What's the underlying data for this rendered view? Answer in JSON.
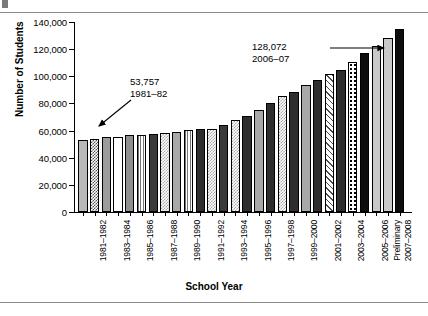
{
  "chart_data": {
    "type": "bar",
    "title": "",
    "xlabel": "School Year",
    "ylabel": "Number of Students",
    "ylim": [
      0,
      140000
    ],
    "ytick_labels": [
      "0",
      "20,000",
      "40,000",
      "60,000",
      "80,000",
      "100,000",
      "120,000",
      "140,000"
    ],
    "ytick_values": [
      0,
      20000,
      40000,
      60000,
      80000,
      100000,
      120000,
      140000
    ],
    "grid": false,
    "legend": "none",
    "categories": [
      "1980-1981",
      "1981-1982",
      "1982-1983",
      "1983-1984",
      "1984-1985",
      "1985-1986",
      "1986-1987",
      "1987-1988",
      "1988-1989",
      "1989-1990",
      "1990-1991",
      "1991-1992",
      "1992-1993",
      "1993-1994",
      "1994-1995",
      "1995-1996",
      "1996-1997",
      "1997-1998",
      "1998-1999",
      "1999-2000",
      "2000-2001",
      "2001-2002",
      "2002-2003",
      "2003-2004",
      "2004-2005",
      "2005-2006",
      "2006-2007",
      "2007-2008"
    ],
    "values": [
      53200,
      53757,
      55000,
      55500,
      56500,
      57000,
      57500,
      58000,
      59000,
      60500,
      61000,
      61500,
      64000,
      67500,
      70500,
      75500,
      80500,
      85500,
      88500,
      93500,
      97500,
      101500,
      104500,
      110500,
      117500,
      122500,
      128072,
      134500
    ],
    "tick_labels_visible": [
      "1981-1982",
      "1983-1984",
      "1985-1986",
      "1987-1988",
      "1989-1990",
      "1991-1992",
      "1993-1994",
      "1995-1996",
      "1997-1998",
      "1999-2000",
      "2001-2002",
      "2003-2004",
      "2005-2006",
      "Preliminary",
      "2007-2008"
    ],
    "annotations": [
      {
        "value": "53,757",
        "year": "1981–82",
        "points_to_category": "1981-1982"
      },
      {
        "value": "128,072",
        "year": "2006–07",
        "points_to_category": "2006-2007"
      }
    ],
    "bar_patterns": [
      "p-solidlight",
      "p-checker",
      "p-solidmid",
      "p-white",
      "p-solidmid2",
      "p-vstripe",
      "p-dark",
      "p-checkerlt",
      "p-solidgray",
      "p-vstripe",
      "p-darker",
      "p-checkerlt",
      "p-dark",
      "p-checkerlt",
      "p-darker",
      "p-solidgray",
      "p-darker",
      "p-checkerlt",
      "p-darker",
      "p-solidgray",
      "p-darker",
      "p-hatch",
      "p-darker",
      "p-dotted",
      "p-black",
      "p-ltgray",
      "p-ltgray",
      "p-black"
    ]
  }
}
